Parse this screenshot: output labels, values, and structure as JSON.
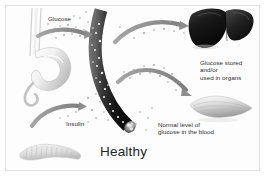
{
  "figure": {
    "title": "Healthy",
    "kind": "medical-illustration",
    "background_color": "#ffffff",
    "frame_color": "#e2e2e2",
    "text_color": "#2b2b2b"
  },
  "labels": {
    "glucose": "Glucose",
    "insulin": "Insulin",
    "glucose_stored": "Glucose stored\nand/or\nused in organs",
    "normal_level": "Normal level of\nglucose in the blood"
  },
  "anatomy": {
    "esophagus": "esophagus",
    "stomach": "stomach",
    "pancreas": "pancreas",
    "blood_vessel": "blood vessel",
    "liver": "liver",
    "muscle": "muscle"
  },
  "flow": {
    "glucose_arrow": "glucose from stomach to bloodstream",
    "insulin_arrow": "insulin from pancreas to bloodstream",
    "liver_arrow": "glucose to liver",
    "muscle_arrow": "glucose to muscle",
    "glucose_particles": "scattered glucose molecules"
  },
  "colors": {
    "arrow_gray": "#8d8d8d",
    "vessel_dark": "#1f1f1f",
    "organ_light": "#d9d9d9",
    "particle": "#b4b4b4"
  }
}
